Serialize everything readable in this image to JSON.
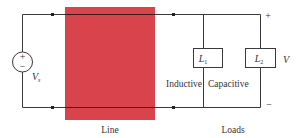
{
  "diagram": {
    "type": "circuit",
    "source": {
      "label": "V",
      "subscript": "s",
      "plus": "+",
      "minus": "−"
    },
    "line": {
      "label": "Line",
      "color": "#D9434B"
    },
    "loads": {
      "label": "Loads",
      "items": [
        {
          "name": "L",
          "subscript": "1",
          "type_label": "Inductive"
        },
        {
          "name": "L",
          "subscript": "2",
          "type_label": "Capacitive"
        }
      ]
    },
    "output": {
      "label": "V",
      "plus": "+",
      "minus": "−"
    }
  },
  "colors": {
    "wire": "#3a3a3a",
    "line_block": "#D9434B"
  }
}
